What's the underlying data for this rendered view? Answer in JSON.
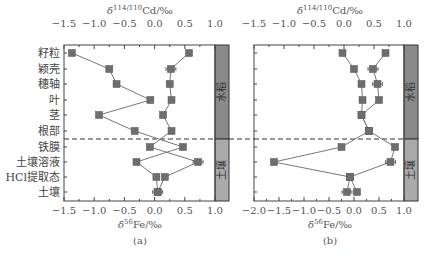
{
  "chart_data": [
    {
      "type": "line",
      "panel_label": "(a)",
      "top_axis": {
        "label_prefix": "δ",
        "label_sup": "114/110",
        "label_suffix": "Cd/‰",
        "ticks": [
          -1.5,
          -1.0,
          -0.5,
          0.0,
          0.5,
          1.0
        ],
        "tick_labels": [
          "−1.5",
          "−1.0",
          "−0.5",
          "0.0",
          "0.5",
          "1.0"
        ],
        "range": [
          -1.5,
          1.0
        ]
      },
      "bottom_axis": {
        "label_prefix": "δ",
        "label_sup": "56",
        "label_suffix": "Fe/‰",
        "ticks": [
          -1.5,
          -1.0,
          -0.5,
          0.0,
          0.5,
          1.0
        ],
        "tick_labels": [
          "−1.5",
          "−1.0",
          "−0.5",
          "0.0",
          "0.5",
          "1.0"
        ],
        "range": [
          -1.5,
          1.0
        ]
      },
      "categories": [
        "籽粒",
        "颖壳",
        "穗轴",
        "叶",
        "茎",
        "根部",
        "铁膜",
        "土壤溶液",
        "HCl提取态",
        "土壤"
      ],
      "series": [
        {
          "name": "series-left",
          "values": [
            -1.37,
            -0.75,
            -0.63,
            -0.07,
            -0.92,
            -0.33,
            0.47,
            -0.3,
            0.03,
            0.05
          ],
          "error_bars_at": []
        },
        {
          "name": "series-right",
          "values": [
            0.57,
            0.27,
            0.25,
            0.28,
            0.14,
            0.28,
            -0.08,
            0.72,
            0.17,
            0.05
          ],
          "error_bars_at": [
            1,
            7,
            9
          ]
        }
      ],
      "bands": [
        {
          "label": "水稻",
          "from": "籽粒",
          "to": "根部",
          "color": "#8a8a8a"
        },
        {
          "label": "土壤",
          "from": "铁膜",
          "to": "土壤",
          "color": "#aaaaaa"
        }
      ],
      "divider": "dashed line between 根部 and 铁膜"
    },
    {
      "type": "line",
      "panel_label": "(b)",
      "top_axis": {
        "label_prefix": "δ",
        "label_sup": "114/110",
        "label_suffix": "Cd/‰",
        "ticks": [
          -1.5,
          -1.0,
          -0.5,
          0.0,
          0.5,
          1.0
        ],
        "tick_labels": [
          "−1.5",
          "−1.0",
          "−0.5",
          "0.0",
          "0.5",
          "1.0"
        ],
        "range": [
          -1.5,
          1.0
        ]
      },
      "bottom_axis": {
        "label_prefix": "δ",
        "label_sup": "56",
        "label_suffix": "Fe/‰",
        "ticks": [
          -2.0,
          -1.5,
          -1.0,
          -0.5,
          0.0,
          0.5,
          1.0
        ],
        "tick_labels": [
          "−2.0",
          "−1.5",
          "−1.0",
          "−0.5",
          "0.0",
          "0.5",
          "1.0"
        ],
        "range": [
          -2.0,
          1.0
        ]
      },
      "categories": [
        "籽粒",
        "颖壳",
        "穗轴",
        "叶",
        "茎",
        "根部",
        "铁膜",
        "土壤溶液",
        "HCl提取态",
        "土壤"
      ],
      "series": [
        {
          "name": "series-left",
          "values": [
            -0.23,
            0.0,
            0.15,
            0.17,
            0.15,
            0.3,
            -0.25,
            -1.6,
            -0.08,
            -0.14
          ],
          "error_bars_at": [
            9
          ]
        },
        {
          "name": "series-right",
          "values": [
            0.63,
            0.38,
            0.47,
            0.5,
            0.15,
            0.3,
            0.82,
            0.73,
            -0.08,
            0.06
          ],
          "error_bars_at": [
            1,
            2,
            7
          ]
        }
      ],
      "bands": [
        {
          "label": "水稻",
          "from": "籽粒",
          "to": "根部",
          "color": "#8a8a8a"
        },
        {
          "label": "土壤",
          "from": "铁膜",
          "to": "土壤",
          "color": "#aaaaaa"
        }
      ],
      "divider": "dashed line between 根部 and 铁膜"
    }
  ],
  "labels": {
    "y_categories": [
      "籽粒",
      "颖壳",
      "穗轴",
      "叶",
      "茎",
      "根部",
      "铁膜",
      "土壤溶液",
      "HCl提取态",
      "土壤"
    ],
    "band_rice": "水稻",
    "band_soil": "土壤",
    "panel_a": "(a)",
    "panel_b": "(b)",
    "cd_axis_title": "δ114/110Cd/‰",
    "fe_axis_title": "δ56Fe/‰"
  }
}
